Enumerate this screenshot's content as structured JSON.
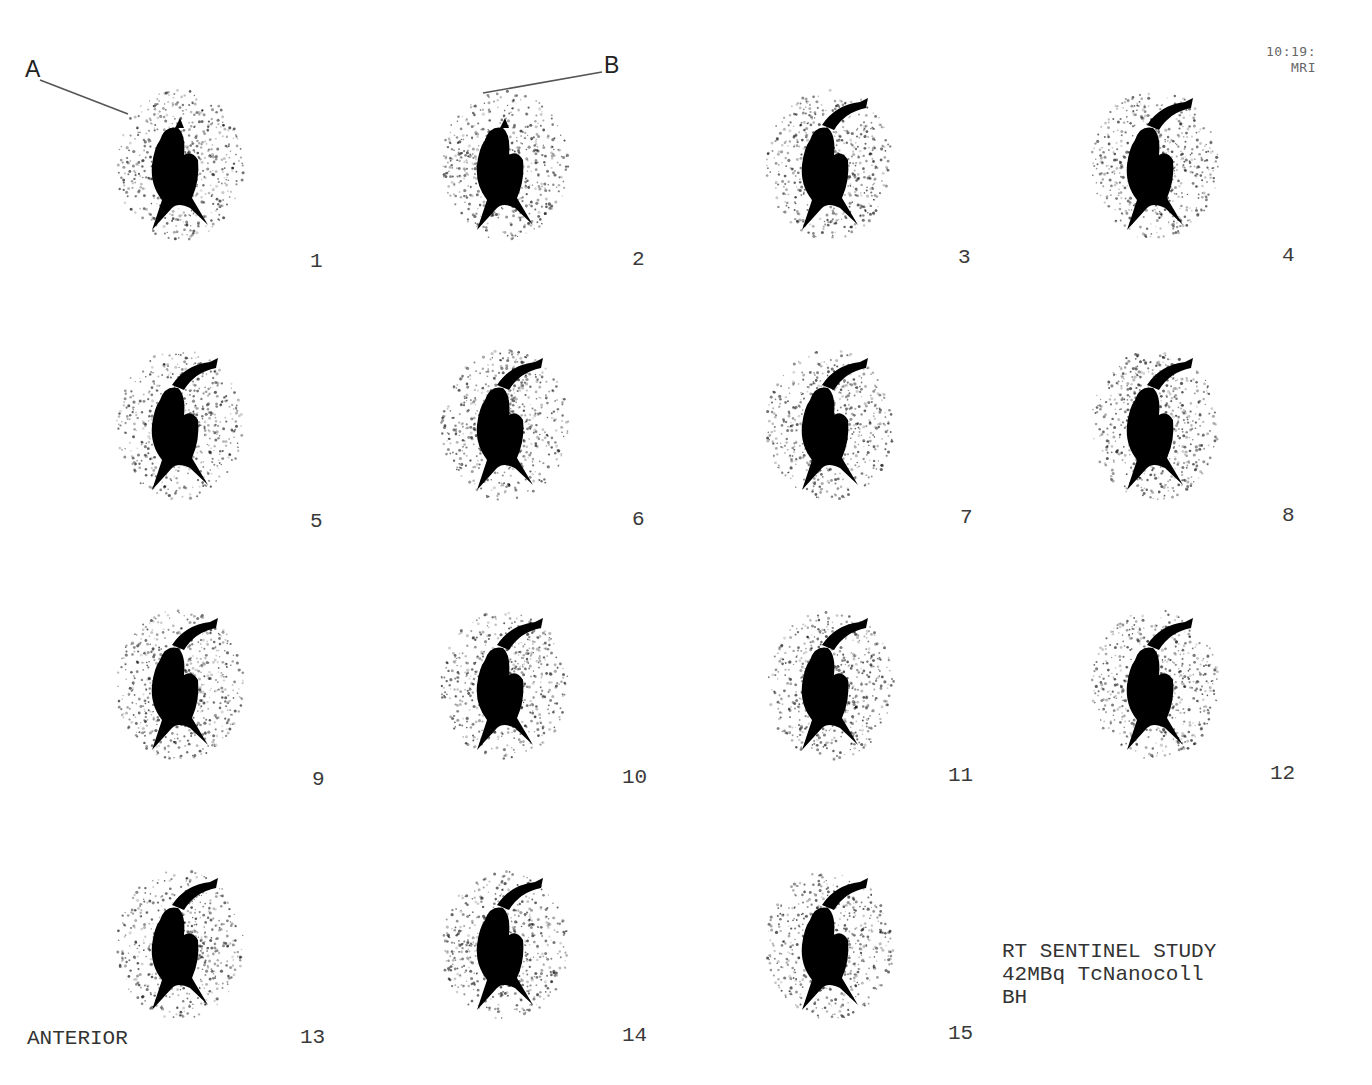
{
  "header": {
    "time": "10:19:",
    "modality": "MRI"
  },
  "annotations": [
    {
      "label": "A",
      "x": 26,
      "y": 58,
      "target_frame": 1
    },
    {
      "label": "B",
      "x": 605,
      "y": 55,
      "target_frame": 2
    }
  ],
  "view_label": "ANTERIOR",
  "study_info": {
    "line1": "RT SENTINEL STUDY",
    "line2": "42MBq TcNanocoll",
    "line3": "BH"
  },
  "frames": [
    {
      "number": "1"
    },
    {
      "number": "2"
    },
    {
      "number": "3"
    },
    {
      "number": "4"
    },
    {
      "number": "5"
    },
    {
      "number": "6"
    },
    {
      "number": "7"
    },
    {
      "number": "8"
    },
    {
      "number": "9"
    },
    {
      "number": "10"
    },
    {
      "number": "11"
    },
    {
      "number": "12"
    },
    {
      "number": "13"
    },
    {
      "number": "14"
    },
    {
      "number": "15"
    }
  ],
  "colors": {
    "background": "#ffffff",
    "uptake": "#000000",
    "text": "#333333"
  }
}
